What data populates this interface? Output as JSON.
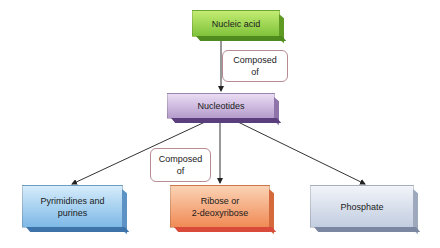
{
  "diagram": {
    "nodes": {
      "nucleic_acid": {
        "label": "Nucleic acid",
        "color": "#8ccf3a"
      },
      "nucleotides": {
        "label": "Nucleotides",
        "color": "#b9a0cf"
      },
      "pyrimidines": {
        "label": "Pyrimidines and purines",
        "line1": "Pyrimidines and",
        "line2": "purines",
        "color": "#8fc3ea"
      },
      "ribose": {
        "label": "Ribose or 2-deoxyribose",
        "line1": "Ribose or",
        "line2": "2-deoxyribose",
        "color": "#f2a070"
      },
      "phosphate": {
        "label": "Phosphate",
        "color": "#c9d3e3"
      }
    },
    "edge_labels": {
      "top": {
        "line1": "Composed",
        "line2": "of"
      },
      "bottom": {
        "line1": "Composed",
        "line2": "of"
      }
    },
    "edges": [
      {
        "from": "Nucleic acid",
        "to": "Nucleotides",
        "label": "Composed of"
      },
      {
        "from": "Nucleotides",
        "to": "Pyrimidines and purines"
      },
      {
        "from": "Nucleotides",
        "to": "Ribose or 2-deoxyribose",
        "label": "Composed of"
      },
      {
        "from": "Nucleotides",
        "to": "Phosphate"
      }
    ]
  }
}
